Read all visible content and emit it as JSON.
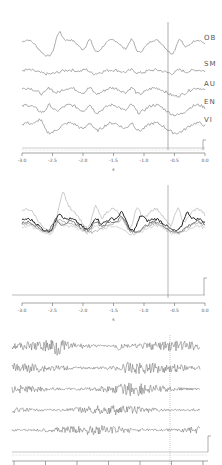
{
  "figure": {
    "panels": [
      {
        "id": "top",
        "top": 0,
        "height": 180,
        "channels": [
          "OB",
          "SM",
          "AU",
          "EN",
          "VI"
        ],
        "x_ticks": [
          "-3.0",
          "-2.5",
          "-2.0",
          "-1.5",
          "-1.0",
          "-0.5",
          "0.0"
        ],
        "x_label": "s",
        "marker_x": 168
      },
      {
        "id": "middle",
        "top": 180,
        "height": 120,
        "x_ticks": [
          "-3.0",
          "-2.5",
          "-2.0",
          "-1.5",
          "-1.0",
          "-0.5",
          "0.0"
        ],
        "x_label": "s",
        "marker_x": 168
      },
      {
        "id": "bottom",
        "top": 300,
        "height": 165,
        "x_ticks": [
          "-3.0",
          "-2.5",
          "-2.0",
          "-1.5",
          "-1.0",
          "-0.5",
          "0.0"
        ],
        "x_label": "s",
        "marker_x": 170
      }
    ]
  },
  "chart_data": [
    {
      "type": "line",
      "title": "Stacked channel traces",
      "xlabel": "s",
      "x_range": [
        -3.0,
        0.0
      ],
      "x_ticks": [
        -3.0,
        -2.5,
        -2.0,
        -1.5,
        -1.0,
        -0.5,
        0.0
      ],
      "grid": false,
      "legend": "right labels",
      "vertical_marker_x": -0.55,
      "series": [
        {
          "name": "OB",
          "peaks_s": [
            -2.7,
            -2.15,
            -1.4,
            -0.45
          ]
        },
        {
          "name": "SM"
        },
        {
          "name": "AU"
        },
        {
          "name": "EN"
        },
        {
          "name": "VI"
        }
      ]
    },
    {
      "type": "line",
      "title": "Superimposed traces",
      "xlabel": "s",
      "x_range": [
        -3.0,
        0.0
      ],
      "x_ticks": [
        -3.0,
        -2.5,
        -2.0,
        -1.5,
        -1.0,
        -0.5,
        0.0
      ],
      "grid": false,
      "vertical_marker_x": -0.55,
      "series_count": 5
    },
    {
      "type": "line",
      "title": "High-frequency stacked traces",
      "xlabel": "s",
      "x_range": [
        -3.0,
        0.0
      ],
      "grid": false,
      "vertical_marker_x": -0.55,
      "series_count": 5
    }
  ]
}
